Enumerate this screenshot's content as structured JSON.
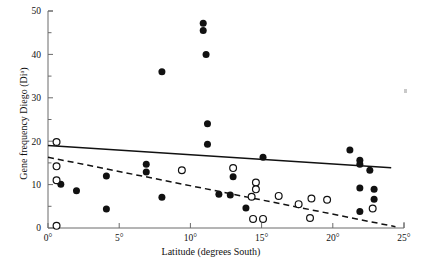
{
  "chart_data": {
    "type": "scatter",
    "title": "",
    "xlabel": "Latitude (degrees South)",
    "ylabel": "Gene frequency Diego (Diᵃ)",
    "xlim": [
      0,
      25
    ],
    "ylim": [
      0,
      50
    ],
    "xticks": [
      0,
      5,
      10,
      15,
      20,
      25
    ],
    "xticklabels": [
      "0°",
      "5°",
      "10°",
      "15°",
      "20°",
      "25°"
    ],
    "yticks": [
      0,
      10,
      20,
      30,
      40,
      50
    ],
    "yticklabels": [
      "0",
      "10",
      "20",
      "30",
      "40",
      "50"
    ],
    "yminorticks": [
      5,
      15,
      25,
      35,
      45
    ],
    "grid": false,
    "legend": null,
    "series": [
      {
        "name": "filled-circles",
        "marker": "filled-circle",
        "color": "#111111",
        "points": [
          [
            0.9,
            10.1
          ],
          [
            2.0,
            8.6
          ],
          [
            4.1,
            12.0
          ],
          [
            4.1,
            4.4
          ],
          [
            6.9,
            14.7
          ],
          [
            6.9,
            12.9
          ],
          [
            8.0,
            36.0
          ],
          [
            8.0,
            7.1
          ],
          [
            10.9,
            47.2
          ],
          [
            10.9,
            45.5
          ],
          [
            11.1,
            40.0
          ],
          [
            11.2,
            24.0
          ],
          [
            11.2,
            19.3
          ],
          [
            12.0,
            7.8
          ],
          [
            12.8,
            7.6
          ],
          [
            13.0,
            11.8
          ],
          [
            13.9,
            4.6
          ],
          [
            15.1,
            16.3
          ],
          [
            21.2,
            18.0
          ],
          [
            21.9,
            15.6
          ],
          [
            21.9,
            14.7
          ],
          [
            21.9,
            9.2
          ],
          [
            21.9,
            3.8
          ],
          [
            22.6,
            13.3
          ],
          [
            22.9,
            8.9
          ],
          [
            22.9,
            6.6
          ]
        ]
      },
      {
        "name": "open-circles",
        "marker": "open-circle",
        "color": "#111111",
        "points": [
          [
            0.6,
            19.8
          ],
          [
            0.6,
            14.2
          ],
          [
            0.6,
            11.0
          ],
          [
            0.6,
            0.5
          ],
          [
            9.4,
            13.3
          ],
          [
            13.0,
            13.8
          ],
          [
            14.6,
            10.5
          ],
          [
            14.6,
            8.9
          ],
          [
            14.3,
            7.2
          ],
          [
            14.4,
            2.1
          ],
          [
            15.1,
            2.1
          ],
          [
            16.2,
            7.4
          ],
          [
            17.6,
            5.5
          ],
          [
            18.5,
            6.8
          ],
          [
            18.4,
            2.3
          ],
          [
            19.6,
            6.5
          ],
          [
            22.8,
            4.5
          ]
        ]
      }
    ],
    "fit_lines": [
      {
        "name": "solid-regression-line",
        "style": "solid",
        "x": [
          0,
          24.1
        ],
        "y": [
          19.0,
          13.9
        ]
      },
      {
        "name": "dashed-regression-line",
        "style": "dashed",
        "x": [
          0,
          24.4
        ],
        "y": [
          16.3,
          0.3
        ]
      }
    ]
  }
}
